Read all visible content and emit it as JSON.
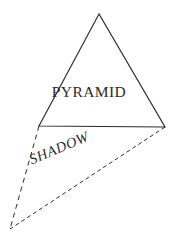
{
  "canvas": {
    "width": 178,
    "height": 244,
    "background_color": "#ffffff",
    "stroke_color": "#2b2b2b",
    "text_color": "#2b2b2b"
  },
  "diagram": {
    "pyramid": {
      "label": "PYRAMID",
      "shape": "triangle",
      "line_style": "solid",
      "points": "99,14 39,126 165,127",
      "vertices": [
        {
          "name": "apex",
          "x": 99,
          "y": 14
        },
        {
          "name": "base-left",
          "x": 39,
          "y": 126
        },
        {
          "name": "base-right",
          "x": 165,
          "y": 127
        }
      ]
    },
    "shadow": {
      "label": "SHADOW",
      "shape": "triangle",
      "line_style": "dashed",
      "rotation_deg": -23,
      "points": "39,126 165,127 10,229",
      "vertices": [
        {
          "name": "base-left",
          "x": 39,
          "y": 126
        },
        {
          "name": "base-right",
          "x": 165,
          "y": 127
        },
        {
          "name": "shadow-tip",
          "x": 10,
          "y": 229
        }
      ],
      "edges": [
        {
          "name": "shadow-edge-left",
          "x1": 39,
          "y1": 126,
          "x2": 10,
          "y2": 229
        },
        {
          "name": "shadow-edge-bottom",
          "x1": 165,
          "y1": 127,
          "x2": 10,
          "y2": 229
        }
      ]
    }
  }
}
